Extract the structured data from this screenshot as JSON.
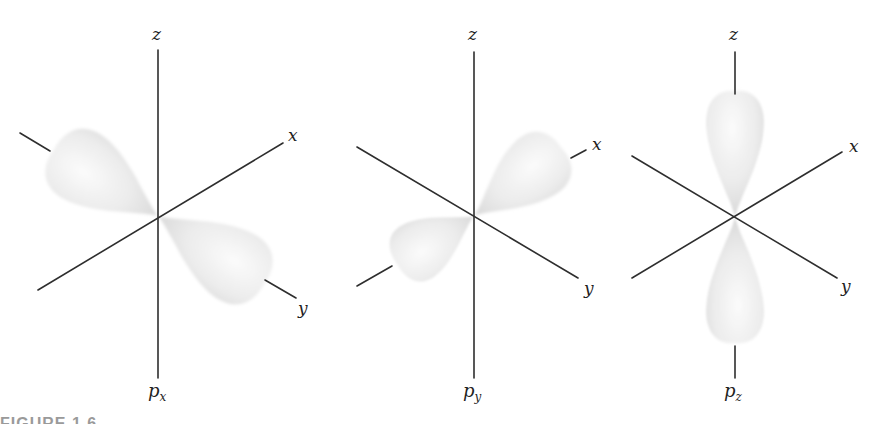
{
  "figure": {
    "caption": "FIGURE 1.6",
    "lobe_color": "#e9e9e9",
    "axis_color": "#2e2e2e",
    "panels": [
      {
        "id": "px",
        "orbital_label": "p",
        "orbital_subscript": "x",
        "axis_labels": {
          "z": "z",
          "x": "x",
          "y": "y"
        },
        "lobe_axis": "x"
      },
      {
        "id": "py",
        "orbital_label": "p",
        "orbital_subscript": "y",
        "axis_labels": {
          "z": "z",
          "x": "x",
          "y": "y"
        },
        "lobe_axis": "y"
      },
      {
        "id": "pz",
        "orbital_label": "p",
        "orbital_subscript": "z",
        "axis_labels": {
          "z": "z",
          "x": "x",
          "y": "y"
        },
        "lobe_axis": "z"
      }
    ]
  }
}
